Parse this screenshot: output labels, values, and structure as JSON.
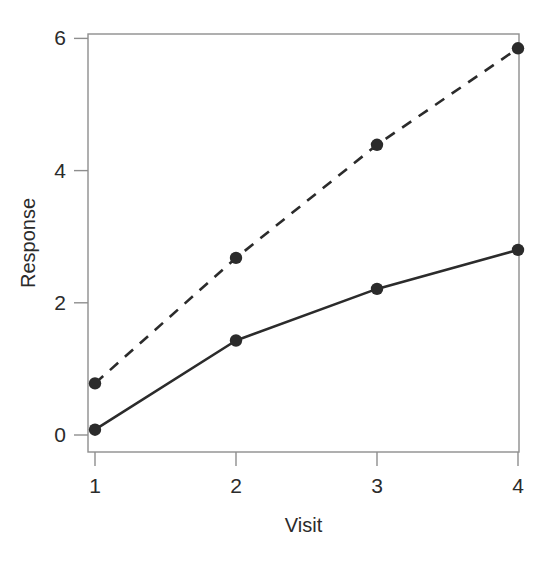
{
  "figure": {
    "cut_off_header_text": "",
    "background_color": "#ffffff",
    "ink_color": "#2b2b2b",
    "frame_color": "#8e8e8e"
  },
  "axes": {
    "x_title": "Visit",
    "y_title": "Response",
    "x_ticks": [
      "1",
      "2",
      "3",
      "4"
    ],
    "y_ticks": [
      "0",
      "2",
      "4",
      "6"
    ]
  },
  "chart_data": {
    "type": "line",
    "title": "",
    "xlabel": "Visit",
    "ylabel": "Response",
    "x": [
      1,
      2,
      3,
      4
    ],
    "xlim": [
      0.8,
      4.2
    ],
    "ylim": [
      -0.2,
      6.3
    ],
    "x_ticks": [
      1,
      2,
      3,
      4
    ],
    "y_ticks": [
      0,
      2,
      4,
      6
    ],
    "grid": false,
    "legend": "none",
    "series": [
      {
        "name": "Solid series",
        "values": [
          0.08,
          1.43,
          2.21,
          2.8
        ],
        "linestyle": "solid",
        "color": "#2b2b2b",
        "marker": "filled-circle"
      },
      {
        "name": "Dashed series",
        "values": [
          0.78,
          2.68,
          4.39,
          5.85
        ],
        "linestyle": "dashed",
        "color": "#2b2b2b",
        "marker": "filled-circle"
      }
    ]
  }
}
